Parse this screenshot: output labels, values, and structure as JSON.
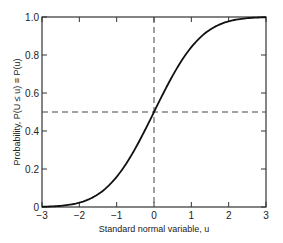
{
  "chart_data": {
    "type": "line",
    "title": "",
    "xlabel": "Standard normal variable, u",
    "ylabel": "Probability, P(U ≤ u) ≡ P(u)",
    "xlim": [
      -3,
      3
    ],
    "ylim": [
      0,
      1.0
    ],
    "xticks": [
      -3,
      -2,
      -1,
      0,
      1,
      2,
      3
    ],
    "xtick_labels": [
      "−3",
      "−2",
      "−1",
      "0",
      "1",
      "2",
      "3"
    ],
    "yticks": [
      0,
      0.2,
      0.4,
      0.6,
      0.8,
      1.0
    ],
    "ytick_labels": [
      "0",
      "0.2",
      "0.4",
      "0.6",
      "0.8",
      "1.0"
    ],
    "grid": false,
    "legend": null,
    "series": [
      {
        "name": "Standard normal CDF",
        "x": [
          -3,
          -2.5,
          -2,
          -1.5,
          -1,
          -0.5,
          0,
          0.5,
          1,
          1.5,
          2,
          2.5,
          3
        ],
        "values": [
          0.0013,
          0.0062,
          0.0228,
          0.0668,
          0.1587,
          0.3085,
          0.5,
          0.6915,
          0.8413,
          0.9332,
          0.9772,
          0.9938,
          0.9987
        ]
      }
    ],
    "reference_lines": [
      {
        "orientation": "vertical",
        "x": 0,
        "style": "dashed"
      },
      {
        "orientation": "horizontal",
        "y": 0.5,
        "style": "dashed"
      }
    ]
  }
}
